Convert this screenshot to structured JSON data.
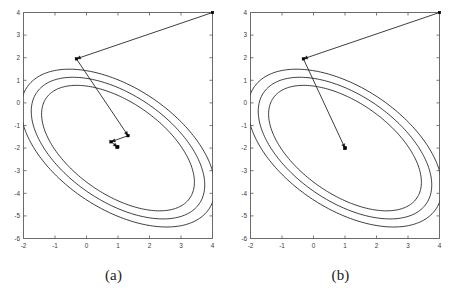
{
  "figure": {
    "background": "#ffffff",
    "line_color": "#1b1b1b",
    "axis_color": "#6b6b6b",
    "marker_color": "#000000"
  },
  "panels": [
    {
      "id": "a",
      "caption": "(a)",
      "chart_data": {
        "type": "line",
        "title": "",
        "xlabel": "",
        "ylabel": "",
        "xlim": [
          -2,
          4
        ],
        "ylim": [
          -6,
          4
        ],
        "xticks": [
          -2,
          -1,
          0,
          1,
          2,
          3,
          4
        ],
        "xticklabels": [
          "-2",
          "-1",
          "0",
          "1",
          "2",
          "3",
          "4"
        ],
        "yticks": [
          -6,
          -5,
          -4,
          -3,
          -2,
          -1,
          0,
          1,
          2,
          3,
          4
        ],
        "yticklabels": [
          "-6",
          "-5",
          "-4",
          "-3",
          "-2",
          "-1",
          "0",
          "1",
          "2",
          "3",
          "4"
        ],
        "grid": false,
        "legend": "none",
        "series": [
          {
            "name": "contour-outer",
            "type": "ellipse",
            "center": [
              1.0,
              -2.0
            ],
            "semi_major": 4.05,
            "semi_minor": 2.3,
            "rotation_deg": -52
          },
          {
            "name": "contour-middle",
            "type": "ellipse",
            "center": [
              1.0,
              -2.0
            ],
            "semi_major": 3.65,
            "semi_minor": 2.02,
            "rotation_deg": -52
          },
          {
            "name": "contour-inner",
            "type": "ellipse",
            "center": [
              1.0,
              -2.0
            ],
            "semi_major": 3.25,
            "semi_minor": 1.74,
            "rotation_deg": -52
          },
          {
            "name": "iterate-path",
            "type": "polyline",
            "points": [
              [
                4.0,
                4.0
              ],
              [
                -0.32,
                1.95
              ],
              [
                1.32,
                -1.45
              ],
              [
                0.78,
                -1.72
              ],
              [
                0.98,
                -1.95
              ]
            ],
            "markers": "square"
          }
        ]
      }
    },
    {
      "id": "b",
      "caption": "(b)",
      "chart_data": {
        "type": "line",
        "title": "",
        "xlabel": "",
        "ylabel": "",
        "xlim": [
          -2,
          4
        ],
        "ylim": [
          -6,
          4
        ],
        "xticks": [
          -2,
          -1,
          0,
          1,
          2,
          3,
          4
        ],
        "xticklabels": [
          "-2",
          "-1",
          "0",
          "1",
          "2",
          "3",
          "4"
        ],
        "yticks": [
          -6,
          -5,
          -4,
          -3,
          -2,
          -1,
          0,
          1,
          2,
          3,
          4
        ],
        "yticklabels": [
          "-6",
          "-5",
          "-4",
          "-3",
          "-2",
          "-1",
          "0",
          "1",
          "2",
          "3",
          "4"
        ],
        "grid": false,
        "legend": "none",
        "series": [
          {
            "name": "contour-outer",
            "type": "ellipse",
            "center": [
              1.0,
              -2.0
            ],
            "semi_major": 4.05,
            "semi_minor": 2.3,
            "rotation_deg": -52
          },
          {
            "name": "contour-middle",
            "type": "ellipse",
            "center": [
              1.0,
              -2.0
            ],
            "semi_major": 3.65,
            "semi_minor": 2.02,
            "rotation_deg": -52
          },
          {
            "name": "contour-inner",
            "type": "ellipse",
            "center": [
              1.0,
              -2.0
            ],
            "semi_major": 3.25,
            "semi_minor": 1.74,
            "rotation_deg": -52
          },
          {
            "name": "iterate-path",
            "type": "polyline",
            "points": [
              [
                4.0,
                4.0
              ],
              [
                -0.32,
                1.95
              ],
              [
                1.0,
                -2.0
              ]
            ],
            "markers": "square"
          }
        ]
      }
    }
  ]
}
